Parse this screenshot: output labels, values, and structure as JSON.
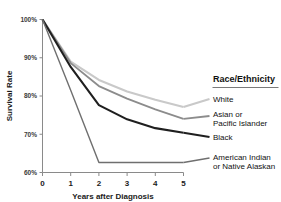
{
  "chart_data": {
    "type": "line",
    "title": "",
    "xlabel": "Years after Diagnosis",
    "ylabel": "Survival Rate",
    "x": [
      0,
      1,
      2,
      3,
      4,
      5
    ],
    "xlim": [
      0,
      5
    ],
    "ylim": [
      60,
      100
    ],
    "xticks": [
      "0",
      "1",
      "2",
      "3",
      "4",
      "5"
    ],
    "yticks": [
      "100%",
      "90%",
      "80%",
      "70%",
      "60%"
    ],
    "ytick_values": [
      100,
      90,
      80,
      70,
      60
    ],
    "grid": false,
    "legend_position": "right",
    "legend_title": "Race/Ethnicity",
    "series": [
      {
        "name": "White",
        "values": [
          100,
          89.0,
          84.2,
          81.2,
          79.0,
          77.1
        ],
        "color": "#c9c9c9",
        "width": 2.1
      },
      {
        "name": "Asian or Pacific Islander",
        "values": [
          100,
          88.6,
          82.6,
          79.3,
          76.5,
          74.0
        ],
        "color": "#8c8c8c",
        "width": 1.8
      },
      {
        "name": "Black",
        "values": [
          100,
          87.6,
          77.6,
          73.9,
          71.6,
          70.4
        ],
        "color": "#1f1f1f",
        "width": 2.1
      },
      {
        "name": "American Indian or Native Alaskan",
        "values": [
          100,
          81.5,
          62.6,
          62.6,
          62.6,
          62.6
        ],
        "color": "#6f6f6f",
        "width": 1.4
      }
    ]
  },
  "legend": {
    "title": "Race/Ethnicity",
    "items": [
      {
        "label_line1": "White",
        "label_line2": ""
      },
      {
        "label_line1": "Asian or",
        "label_line2": "Pacific Islander"
      },
      {
        "label_line1": "Black",
        "label_line2": ""
      },
      {
        "label_line1": "American Indian",
        "label_line2": "or Native Alaskan"
      }
    ]
  }
}
